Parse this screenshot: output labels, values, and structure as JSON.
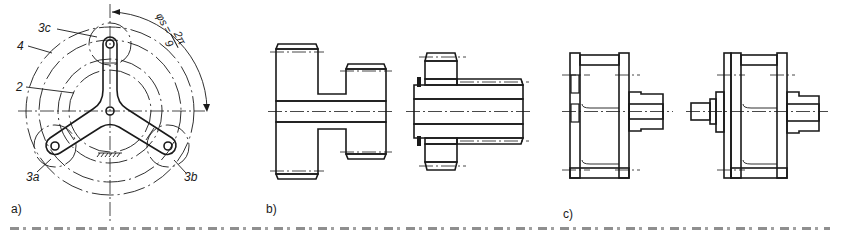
{
  "figure": {
    "panels": [
      {
        "id": "a",
        "label": "a)",
        "callouts": [
          "3c",
          "4",
          "2",
          "3a",
          "3b"
        ],
        "angle_annotation": {
          "symbol": "φs",
          "equals": "=",
          "numerator": "2π",
          "denominator": "9"
        }
      },
      {
        "id": "b",
        "label": "b)"
      },
      {
        "id": "c",
        "label": "c)"
      }
    ],
    "caption_visible": false
  },
  "colors": {
    "ink": "#1a1a1a",
    "paper": "#ffffff"
  }
}
